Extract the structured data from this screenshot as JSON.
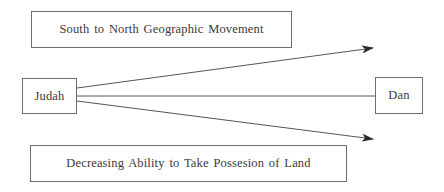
{
  "diagram": {
    "top_label": "South to North Geographic Movement",
    "bottom_label": "Decreasing Ability to Take Possesion of Land",
    "nodes": {
      "start": "Judah",
      "end": "Dan"
    },
    "connections": [
      {
        "from": "Judah",
        "to": "upper-right",
        "type": "arrow",
        "annotation": "South to North Geographic Movement"
      },
      {
        "from": "Judah",
        "to": "Dan",
        "type": "line"
      },
      {
        "from": "Judah",
        "to": "lower-right",
        "type": "arrow",
        "annotation": "Decreasing Ability to Take Possesion of Land"
      }
    ],
    "colors": {
      "line": "#555555",
      "border": "#6e6e6e",
      "text": "#3a3a3a",
      "background": "#ffffff"
    }
  }
}
